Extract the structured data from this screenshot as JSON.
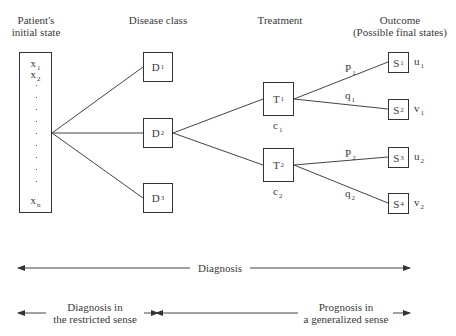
{
  "headers": {
    "patient": [
      "Patient's",
      "initial state"
    ],
    "disease": "Disease class",
    "treatment": "Treatment",
    "outcome": [
      "Outcome",
      "(Possible final states)"
    ]
  },
  "patient_state": {
    "first": {
      "base": "x",
      "sub": "1"
    },
    "second": {
      "base": "x",
      "sub": "2"
    },
    "last": {
      "base": "x",
      "sub": "n"
    }
  },
  "disease_classes": [
    {
      "base": "D",
      "sub": "1"
    },
    {
      "base": "D",
      "sub": "2"
    },
    {
      "base": "D",
      "sub": "3"
    }
  ],
  "treatments": [
    {
      "base": "T",
      "sub": "1",
      "cost": {
        "base": "c",
        "sub": "1"
      }
    },
    {
      "base": "T",
      "sub": "2",
      "cost": {
        "base": "c",
        "sub": "2"
      }
    }
  ],
  "branch_probabilities": [
    {
      "base": "P",
      "sub": "1"
    },
    {
      "base": "q",
      "sub": "1"
    },
    {
      "base": "P",
      "sub": "2"
    },
    {
      "base": "q",
      "sub": "2"
    }
  ],
  "outcomes": [
    {
      "base": "S",
      "sub": "1",
      "utility": {
        "base": "u",
        "sub": "1"
      }
    },
    {
      "base": "S",
      "sub": "2",
      "utility": {
        "base": "v",
        "sub": "1"
      }
    },
    {
      "base": "S",
      "sub": "3",
      "utility": {
        "base": "u",
        "sub": "2"
      }
    },
    {
      "base": "S",
      "sub": "4",
      "utility": {
        "base": "v",
        "sub": "2"
      }
    }
  ],
  "scope_arrows": {
    "overall": "Diagnosis",
    "restricted": [
      "Diagnosis in",
      "the restricted sense"
    ],
    "prognosis": [
      "Prognosis in",
      "a generalized sense"
    ]
  },
  "colors": {
    "line": "#333333",
    "text": "#3a3a3a",
    "background": "#ffffff"
  }
}
